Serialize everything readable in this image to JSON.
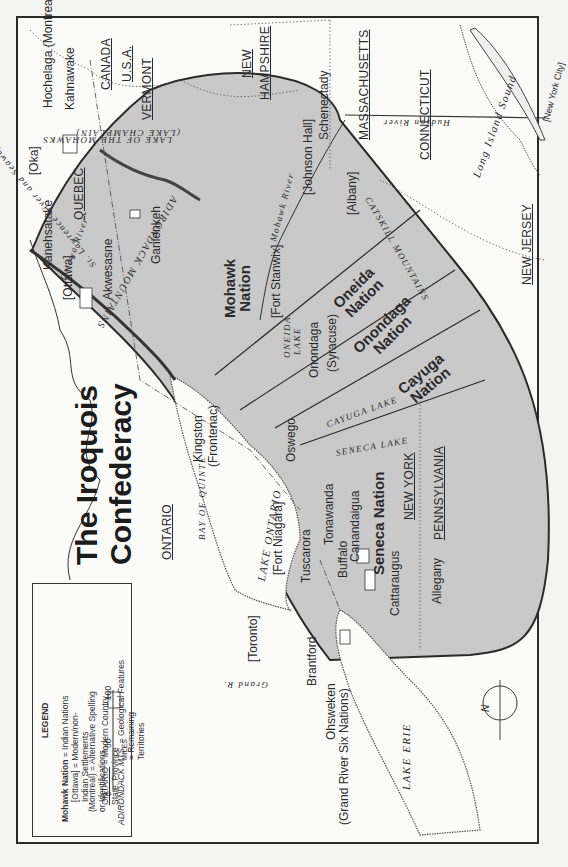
{
  "title": {
    "line1": "The Iroquois",
    "line2": "Confederacy"
  },
  "legend": {
    "heading": "LEGEND",
    "items": [
      {
        "sample": "Mohawk Nation",
        "desc": "= Indian Nations"
      },
      {
        "sample": "[Ottawa]",
        "desc": "= Modern/non-",
        "desc2": "Indian Settlements"
      },
      {
        "sample": "(Montreal)",
        "desc": "= Alternative Spelling",
        "desc2": "or Identifications"
      },
      {
        "sample": "ONTARIO",
        "desc": "= Modern Country,",
        "desc2": "State, Province"
      },
      {
        "sample": "ADIRONDACK MTS.",
        "desc": "= Geological Features"
      },
      {
        "sample": "hatch",
        "desc": "= Remaining",
        "desc2": "Territories"
      }
    ],
    "scale": {
      "ticks": [
        "0",
        "50",
        "100"
      ],
      "unit": "MILES"
    }
  },
  "nations": [
    {
      "name": "Mohawk",
      "suffix": "Nation"
    },
    {
      "name": "Oneida",
      "suffix": "Nation"
    },
    {
      "name": "Onondaga",
      "suffix": "Nation"
    },
    {
      "name": "Cayuga",
      "suffix": "Nation"
    },
    {
      "name": "Seneca Nation"
    }
  ],
  "regions": {
    "canada": "CANADA",
    "usa": "U.S.A.",
    "vermont": "VERMONT",
    "new_hampshire_1": "NEW",
    "new_hampshire_2": "HAMPSHIRE",
    "massachusetts": "MASSACHUSETTS",
    "connecticut": "CONNECTICUT",
    "new_jersey": "NEW JERSEY",
    "new_york": "NEW YORK",
    "pennsylvania": "PENNSYLVANIA",
    "quebec": "QUEBEC",
    "ontario": "ONTARIO"
  },
  "settlements": {
    "hochelaga": "Hochelaga (Montreal)",
    "kahnawake": "Kahnawake",
    "oka": "[Oka]",
    "kanehsatake": "Kanehsatake",
    "ottawa": "[Ottawa]",
    "akwesasne": "Akwesasne",
    "ganienkeh": "Ganienkeh",
    "johnson_hall": "[Johnson Hall]",
    "schenectady": "Schenectady",
    "albany": "[Albany]",
    "fort_stanwix": "[Fort Stanwix]",
    "onondaga": "Onondaga",
    "syracuse": "(Syracuse)",
    "kingston": "Kingston",
    "frontenac": "(Frontenac)",
    "oswego": "Oswego",
    "fort_niagara": "[Fort Niagara]",
    "tuscarora": "Tuscarora",
    "tonawanda": "Tonawanda",
    "buffalo": "Buffalo",
    "canandaigua": "Canandaigua",
    "cattaraugus": "Cattaraugus",
    "allegany": "Allegany",
    "toronto": "[Toronto]",
    "brantford": "Brantford",
    "ohsweken": "Ohsweken",
    "grand_river": "(Grand River Six Nations)",
    "new_york_city": "[New York City]"
  },
  "geo": {
    "ottawa_river": "Ottawa River",
    "st_lawrence": "St. Lawrence River and Seaway",
    "lake_champlain_1": "LAKE OF THE MOHAWKS",
    "lake_champlain_2": "(LAKE CHAMPLAIN)",
    "adirondack": "ADIRONDACK MOUNTAINS",
    "mohawk_river": "Mohawk River",
    "hudson_river": "Hudson River",
    "catskill": "CATSKILL MOUNTAINS",
    "oneida_lake_1": "ONEIDA",
    "oneida_lake_2": "LAKE",
    "cayuga_lake": "CAYUGA LAKE",
    "seneca_lake": "SENECA LAKE",
    "lake_ontario": "LAKE ONTARIO",
    "bay_of_quinte": "BAY OF QUINTE",
    "lake_erie": "LAKE ERIE",
    "grand_r": "Grand R.",
    "long_island_sound": "Long Island Sound"
  },
  "compass": {
    "label": "N"
  },
  "colors": {
    "territory": "#c9c9c9",
    "land": "#fbfbfa",
    "line": "#2a2a2a"
  }
}
